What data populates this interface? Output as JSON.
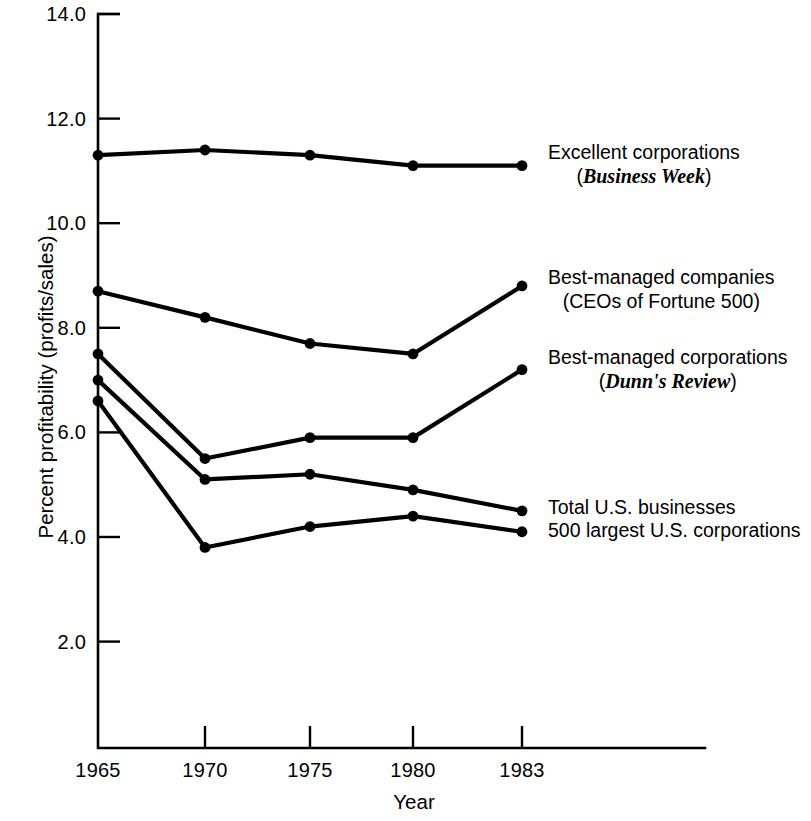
{
  "chart_data": {
    "type": "line",
    "title": "",
    "xlabel": "Year",
    "ylabel": "Percent profitability (profits/sales)",
    "x": [
      1965,
      1970,
      1975,
      1980,
      1983
    ],
    "xticklabels": [
      "1965",
      "1970",
      "1975",
      "1980",
      "1983"
    ],
    "yticks": [
      2.0,
      4.0,
      6.0,
      8.0,
      10.0,
      12.0,
      14.0
    ],
    "yticklabels": [
      "2.0",
      "4.0",
      "6.0",
      "8.0",
      "10.0",
      "12.0",
      "14.0"
    ],
    "ylim": [
      0.0,
      14.0
    ],
    "xlim": [
      1965,
      1983
    ],
    "grid": false,
    "legend_position": "right-inline-annotations",
    "series": [
      {
        "name": "Excellent corporations",
        "source": "Business Week",
        "values": [
          11.3,
          11.4,
          11.3,
          11.1,
          11.1
        ]
      },
      {
        "name": "Best-managed companies",
        "source": "CEOs of Fortune 500",
        "values": [
          8.7,
          8.2,
          7.7,
          7.5,
          8.8
        ]
      },
      {
        "name": "Best-managed corporations",
        "source": "Dunn's Review",
        "values": [
          7.5,
          5.5,
          5.9,
          5.9,
          7.2
        ]
      },
      {
        "name": "Total U.S. businesses",
        "source": "",
        "values": [
          7.0,
          5.1,
          5.2,
          4.9,
          4.5
        ]
      },
      {
        "name": "500 largest U.S. corporations",
        "source": "",
        "values": [
          6.6,
          3.8,
          4.2,
          4.4,
          4.1
        ]
      }
    ]
  },
  "annotations": [
    {
      "line1": "Excellent corporations",
      "line2_open": "(",
      "line2_italic": "Business Week",
      "line2_close": ")"
    },
    {
      "line1": "Best-managed companies",
      "line2_open": "",
      "line2_italic": "",
      "line2_close": "(CEOs of Fortune 500)"
    },
    {
      "line1": "Best-managed corporations",
      "line2_open": "(",
      "line2_italic": "Dunn's Review",
      "line2_close": ")"
    },
    {
      "line1": "Total U.S. businesses",
      "line2_open": "",
      "line2_italic": "",
      "line2_close": ""
    },
    {
      "line1": "500 largest U.S. corporations",
      "line2_open": "",
      "line2_italic": "",
      "line2_close": ""
    }
  ],
  "colors": {
    "ink": "#000000",
    "background": "#ffffff"
  }
}
